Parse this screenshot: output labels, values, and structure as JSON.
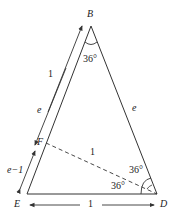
{
  "diagram": {
    "vertices": {
      "B": "B",
      "E": "E",
      "D": "D",
      "F": "F"
    },
    "angles": {
      "apex_B": "36°",
      "D_upper": "36°",
      "D_lower": "36°"
    },
    "edges": {
      "BD": "e",
      "FD": "1",
      "ED": "1",
      "BF_arrow": "1",
      "EF_arrow_upper": "e",
      "EF_arrow_lower": "e−1"
    },
    "colors": {
      "line": "#333333",
      "background": "#ffffff"
    }
  }
}
